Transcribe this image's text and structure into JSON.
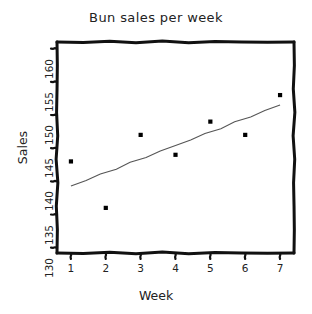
{
  "chart_data": {
    "type": "scatter",
    "title": "Bun sales per week",
    "xlabel": "Week",
    "ylabel": "Sales",
    "style": "hand-drawn",
    "grid": false,
    "legend": null,
    "x": [
      1,
      2,
      3,
      4,
      5,
      6,
      7
    ],
    "values": [
      143,
      136,
      147,
      144,
      149,
      147,
      153
    ],
    "series": [
      {
        "name": "Bun sales",
        "type": "scatter",
        "marker": "square",
        "color": "#000000",
        "x": [
          1,
          2,
          3,
          4,
          5,
          6,
          7
        ],
        "values": [
          143,
          136,
          147,
          144,
          149,
          147,
          153
        ]
      },
      {
        "name": "trend line",
        "type": "line",
        "color": "#555555",
        "x": [
          1,
          7
        ],
        "values": [
          139.3,
          151.5
        ]
      }
    ],
    "xlim": [
      0.6,
      7.4
    ],
    "ylim": [
      129.2,
      161.0
    ],
    "xticks": [
      1,
      2,
      3,
      4,
      5,
      6,
      7
    ],
    "yticks": [
      130,
      135,
      140,
      145,
      150,
      155,
      160
    ],
    "xtick_labels": [
      "1",
      "2",
      "3",
      "4",
      "5",
      "6",
      "7"
    ],
    "ytick_labels": [
      "130",
      "135",
      "140",
      "145",
      "150",
      "155",
      "160"
    ]
  },
  "colors": {
    "axis": "#111111",
    "marker": "#000000",
    "trend": "#555555",
    "background": "#ffffff",
    "text": "#222222"
  }
}
